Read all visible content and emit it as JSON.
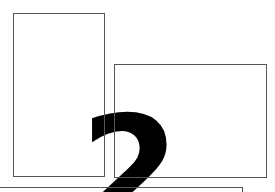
{
  "figure": {
    "glyph": "2",
    "colors": {
      "background": "#ffffff",
      "border": "#555555",
      "glyph": "#000000"
    },
    "boxes": [
      {
        "id": "box-a"
      },
      {
        "id": "box-b"
      },
      {
        "id": "box-c"
      }
    ]
  }
}
